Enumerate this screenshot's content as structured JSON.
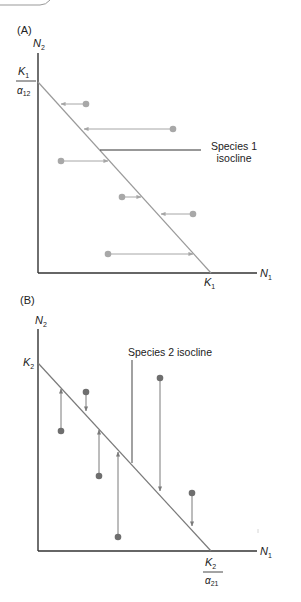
{
  "colors": {
    "axis": "#333333",
    "isocline_line": "#8c8c8c",
    "arrow_panel_a": "#a6a6a6",
    "dot_panel_a": "#a8a8a8",
    "arrow_panel_b": "#7a7a7a",
    "dot_panel_b": "#6e6e6e",
    "label_pointer": "#333333"
  },
  "panel_a": {
    "label": "(A)",
    "y_axis_label": "N",
    "y_axis_sub": "2",
    "x_axis_label": "N",
    "x_axis_sub": "1",
    "y_intercept_num": "K",
    "y_intercept_num_sub": "1",
    "y_intercept_den": "α",
    "y_intercept_den_sub": "12",
    "x_intercept": "K",
    "x_intercept_sub": "1",
    "isocline_label_line1": "Species 1",
    "isocline_label_line2": "isocline"
  },
  "panel_b": {
    "label": "(B)",
    "y_axis_label": "N",
    "y_axis_sub": "2",
    "x_axis_label": "N",
    "x_axis_sub": "1",
    "y_intercept": "K",
    "y_intercept_sub": "2",
    "x_intercept_num": "K",
    "x_intercept_num_sub": "2",
    "x_intercept_den": "α",
    "x_intercept_den_sub": "21",
    "isocline_label": "Species 2 isocline"
  }
}
